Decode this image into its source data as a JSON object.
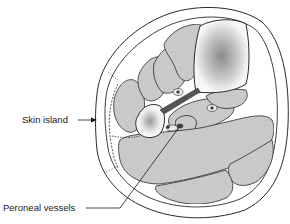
{
  "figure": {
    "labels": [
      {
        "id": "skin-island",
        "text": "Skin island"
      },
      {
        "id": "peroneal-vessels",
        "text": "Peroneal vessels"
      }
    ],
    "colors": {
      "outline": "#2a2a2a",
      "muscle_fill": "#cfcfcf",
      "bone_fill": "#f4f4f4",
      "skin_fill": "#ffffff",
      "vessel_fill": "#555555"
    }
  }
}
